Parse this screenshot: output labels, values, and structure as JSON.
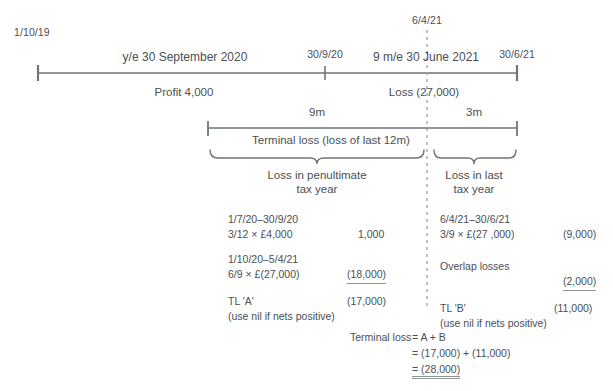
{
  "timeline": {
    "start_date": "1/10/19",
    "mid_date": "30/9/20",
    "end_date": "30/6/21",
    "marker_date": "6/4/21",
    "period_left": "y/e 30 September 2020",
    "period_right": "9 m/e 30 June 2021",
    "result_left": "Profit 4,000",
    "result_right": "Loss (27,000)"
  },
  "spans": {
    "left_months": "9m",
    "right_months": "3m",
    "terminal_loss_label": "Terminal loss (loss of last 12m)"
  },
  "braces": {
    "left_line1": "Loss in penultimate",
    "left_line2": "tax year",
    "right_line1": "Loss in last",
    "right_line2": "tax year"
  },
  "calc_left": {
    "rows": [
      {
        "line1": "1/7/20–30/9/20",
        "line2": "3/12 × £4,000",
        "value": "1,000",
        "underline": false
      },
      {
        "line1": "1/10/20–5/4/21",
        "line2": "6/9 × £(27,000)",
        "value": "(18,000)",
        "underline": true
      }
    ],
    "total_label": "TL 'A'",
    "total_value": "(17,000)",
    "note": "(use nil if nets positive)"
  },
  "calc_right": {
    "rows": [
      {
        "line1": "6/4/21–30/6/21",
        "line2": "3/9 × £(27 ,000)",
        "value": "(9,000)",
        "underline": false
      },
      {
        "line1": "",
        "line2": "Overlap losses",
        "value": "(2,000)",
        "underline": true
      }
    ],
    "total_label": "TL 'B'",
    "total_value": "(11,000)",
    "note": "(use nil if nets positive)"
  },
  "summary": {
    "label": "Terminal loss",
    "line1": "= A + B",
    "line2": "= (17,000) + (11,000)",
    "line3": "= (28,000)"
  },
  "colors": {
    "ink": "#4a4f54",
    "rule": "#6e7479",
    "dash": "#9aa0a6",
    "background": "#ffffff"
  }
}
